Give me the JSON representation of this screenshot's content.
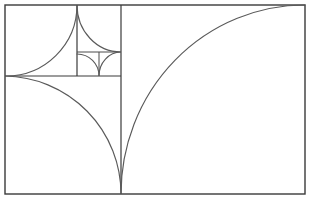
{
  "figure": {
    "kind": "geometric-diagram",
    "background_color": "#ffffff",
    "line_color": "#3a3a3a",
    "spiral_color": "#5a5a5a",
    "canvas": {
      "width": 312,
      "height": 207
    },
    "outer_rectangle": {
      "name": "golden-rectangle",
      "x": 5,
      "y": 5,
      "width": 300,
      "height": 189
    },
    "squares": [
      {
        "name": "square-large",
        "x": 5,
        "y": 76,
        "size": 118,
        "fib": 13
      },
      {
        "name": "square-medium",
        "x": 5,
        "y": 5,
        "size": 71,
        "fib": 8
      },
      {
        "name": "square-small",
        "x": 77,
        "y": 5,
        "size": 44,
        "fib": 5
      },
      {
        "name": "square-tiny-right",
        "x": 99,
        "y": 52,
        "size": 22,
        "fib": 3
      },
      {
        "name": "square-tiny-left",
        "x": 77,
        "y": 52,
        "size": 22,
        "fib": 2
      }
    ],
    "dividers": [
      {
        "name": "divider-vertical-main",
        "x1": 121,
        "y1": 5,
        "x2": 121,
        "y2": 194
      },
      {
        "name": "divider-horizontal-main",
        "x1": 5,
        "y1": 76,
        "x2": 121,
        "y2": 76
      },
      {
        "name": "divider-vertical-upper",
        "x1": 77,
        "y1": 5,
        "x2": 77,
        "y2": 76
      },
      {
        "name": "divider-horizontal-upper",
        "x1": 77,
        "y1": 52,
        "x2": 121,
        "y2": 52
      },
      {
        "name": "divider-vertical-tiny",
        "x1": 99,
        "y1": 52,
        "x2": 99,
        "y2": 76
      }
    ],
    "spiral": {
      "name": "golden-spiral",
      "description": "quarter-circle arcs chained through each Fibonacci square",
      "path": "M 305 5 A 184 189 0 0 0 121 194 A 118 118 0 0 0 5 76 A 71 71 0 0 0 77 5 A 44 47 0 0 0 121 52 A 22 24 0 0 0 99 76 A 22 22 0 0 0 77 54"
    }
  }
}
